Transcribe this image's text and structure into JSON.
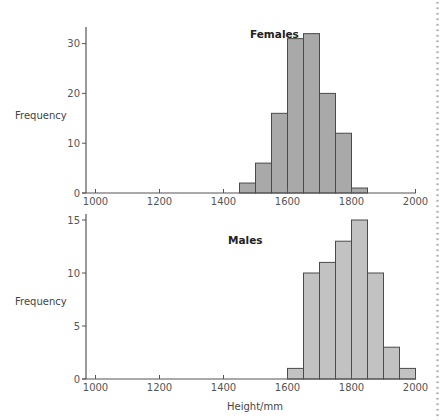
{
  "chart_data": [
    {
      "type": "bar",
      "title": "Females",
      "xlabel": "",
      "ylabel": "Frequency",
      "bin_width": 50,
      "bins": [
        [
          1450,
          1500
        ],
        [
          1500,
          1550
        ],
        [
          1550,
          1600
        ],
        [
          1600,
          1650
        ],
        [
          1650,
          1700
        ],
        [
          1700,
          1750
        ],
        [
          1750,
          1800
        ],
        [
          1800,
          1850
        ]
      ],
      "values": [
        2,
        6,
        16,
        31,
        32,
        20,
        12,
        1
      ],
      "xlim": [
        980,
        2000
      ],
      "ylim": [
        0,
        33
      ],
      "xticks": [
        1000,
        1200,
        1400,
        1600,
        1800,
        2000
      ],
      "yticks": [
        0,
        10,
        20,
        30
      ],
      "fill": "#a9a9a9",
      "grid": false
    },
    {
      "type": "bar",
      "title": "Males",
      "xlabel": "Height/mm",
      "ylabel": "Frequency",
      "bin_width": 50,
      "bins": [
        [
          1600,
          1650
        ],
        [
          1650,
          1700
        ],
        [
          1700,
          1750
        ],
        [
          1750,
          1800
        ],
        [
          1800,
          1850
        ],
        [
          1850,
          1900
        ],
        [
          1900,
          1950
        ],
        [
          1950,
          2000
        ]
      ],
      "values": [
        1,
        10,
        11,
        13,
        15,
        10,
        3,
        1
      ],
      "xlim": [
        980,
        2000
      ],
      "ylim": [
        0,
        15
      ],
      "xticks": [
        1000,
        1200,
        1400,
        1600,
        1800,
        2000
      ],
      "yticks": [
        0,
        5,
        10,
        15
      ],
      "fill": "#c2c2c2",
      "grid": false
    }
  ],
  "labels": {
    "females_title": "Females",
    "males_title": "Males",
    "ylabel_top": "Frequency",
    "ylabel_bottom": "Frequency",
    "xlabel": "Height/mm"
  }
}
